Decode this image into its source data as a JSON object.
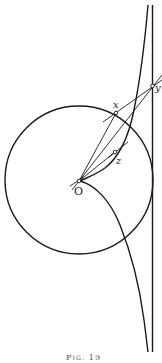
{
  "figure": {
    "caption": "Fig. 19",
    "labels": {
      "x": "x",
      "y": "y",
      "z": "z",
      "origin": "O"
    },
    "colors": {
      "ink": "#1a1a1a",
      "background": "#ffffff"
    },
    "elements": [
      "circle centered at O",
      "vertical asymptote line on right",
      "tractrix-like curve with cusp at O",
      "line O-y through x",
      "line O-z",
      "tangent segment through z",
      "secant x-y"
    ]
  }
}
